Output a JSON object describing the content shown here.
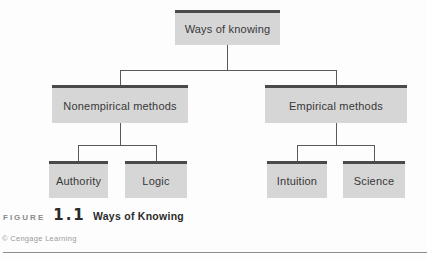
{
  "figure": {
    "label": "FIGURE",
    "number": "1.1",
    "title": "Ways of Knowing",
    "credit": "© Cengage Learning"
  },
  "diagram": {
    "root": {
      "label": "Ways of knowing"
    },
    "level2": {
      "nonempirical": {
        "label": "Nonempirical methods"
      },
      "empirical": {
        "label": "Empirical methods"
      }
    },
    "level3": {
      "authority": {
        "label": "Authority"
      },
      "logic": {
        "label": "Logic"
      },
      "intuition": {
        "label": "Intuition"
      },
      "science": {
        "label": "Science"
      }
    },
    "edges": [
      [
        "Ways of knowing",
        "Nonempirical methods"
      ],
      [
        "Ways of knowing",
        "Empirical methods"
      ],
      [
        "Nonempirical methods",
        "Authority"
      ],
      [
        "Nonempirical methods",
        "Logic"
      ],
      [
        "Empirical methods",
        "Intuition"
      ],
      [
        "Empirical methods",
        "Science"
      ]
    ],
    "colors": {
      "box_fill": "#d6d6d6",
      "box_border_top": "#4a4a4a",
      "connector": "#5a5a5a",
      "caption_text": "#2a2a2a",
      "muted_text": "#8a8a8a"
    }
  }
}
